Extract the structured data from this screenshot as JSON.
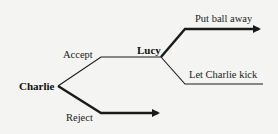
{
  "diagram": {
    "type": "game-tree",
    "players": {
      "root": "Charlie",
      "second": "Lucy"
    },
    "branches": {
      "accept": "Accept",
      "reject": "Reject",
      "put_ball_away": "Put ball away",
      "let_charlie_kick": "Let Charlie kick"
    },
    "colors": {
      "background": "#f4f4f2",
      "line": "#1a1a1a",
      "text": "#222222"
    }
  }
}
